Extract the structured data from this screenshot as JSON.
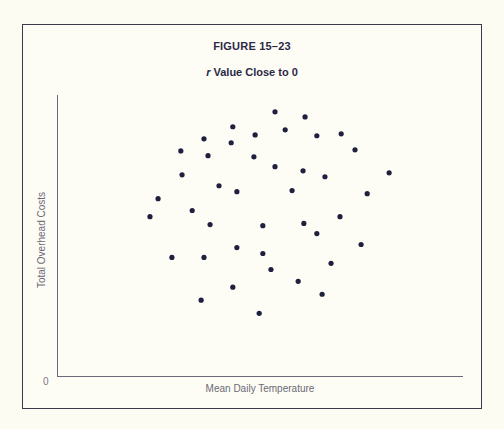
{
  "figure": {
    "number": "FIGURE 15–23",
    "title_var": "r",
    "title_rest": " Value Close to 0"
  },
  "axes": {
    "x_label": "Mean Daily Temperature",
    "y_label": "Total Overhead Costs",
    "origin_label": "0"
  },
  "colors": {
    "point": "#1f1f40",
    "axis": "#6a6a78",
    "border": "#3a3a4a"
  },
  "chart_data": {
    "type": "scatter",
    "title": "r Value Close to 0",
    "subtitle": "FIGURE 15–23",
    "xlabel": "Mean Daily Temperature",
    "ylabel": "Total Overhead Costs",
    "xlim": [
      0,
      100
    ],
    "ylim": [
      0,
      100
    ],
    "grid": false,
    "legend": null,
    "note": "Unscaled axes; points given in relative units (0–100) estimated from position. Illustrates near-zero correlation.",
    "points": [
      {
        "x": 53.7,
        "y": 94.0
      },
      {
        "x": 61.1,
        "y": 92.2
      },
      {
        "x": 43.3,
        "y": 88.7
      },
      {
        "x": 56.2,
        "y": 87.6
      },
      {
        "x": 48.8,
        "y": 85.8
      },
      {
        "x": 64.0,
        "y": 85.5
      },
      {
        "x": 70.0,
        "y": 86.2
      },
      {
        "x": 36.2,
        "y": 84.4
      },
      {
        "x": 42.9,
        "y": 83.0
      },
      {
        "x": 73.4,
        "y": 80.5
      },
      {
        "x": 30.5,
        "y": 80.1
      },
      {
        "x": 37.2,
        "y": 78.4
      },
      {
        "x": 48.5,
        "y": 78.0
      },
      {
        "x": 53.7,
        "y": 74.5
      },
      {
        "x": 60.6,
        "y": 73.0
      },
      {
        "x": 81.8,
        "y": 72.3
      },
      {
        "x": 30.8,
        "y": 71.6
      },
      {
        "x": 66.0,
        "y": 70.9
      },
      {
        "x": 39.9,
        "y": 67.7
      },
      {
        "x": 44.3,
        "y": 65.6
      },
      {
        "x": 57.9,
        "y": 66.0
      },
      {
        "x": 76.4,
        "y": 64.9
      },
      {
        "x": 24.9,
        "y": 63.1
      },
      {
        "x": 33.3,
        "y": 58.9
      },
      {
        "x": 69.7,
        "y": 56.7
      },
      {
        "x": 22.9,
        "y": 56.7
      },
      {
        "x": 60.8,
        "y": 54.3
      },
      {
        "x": 37.7,
        "y": 53.9
      },
      {
        "x": 50.7,
        "y": 53.5
      },
      {
        "x": 64.0,
        "y": 50.7
      },
      {
        "x": 74.9,
        "y": 46.8
      },
      {
        "x": 44.3,
        "y": 45.7
      },
      {
        "x": 50.7,
        "y": 43.6
      },
      {
        "x": 28.3,
        "y": 42.2
      },
      {
        "x": 36.2,
        "y": 42.2
      },
      {
        "x": 67.5,
        "y": 40.1
      },
      {
        "x": 52.7,
        "y": 37.9
      },
      {
        "x": 59.4,
        "y": 33.7
      },
      {
        "x": 43.3,
        "y": 31.6
      },
      {
        "x": 65.3,
        "y": 29.1
      },
      {
        "x": 35.5,
        "y": 27.0
      },
      {
        "x": 49.8,
        "y": 22.3
      }
    ]
  }
}
